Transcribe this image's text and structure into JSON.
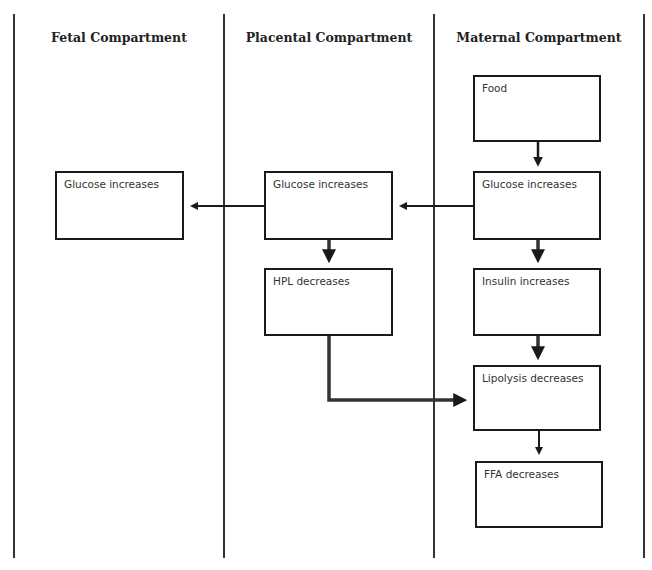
{
  "columns": [
    {
      "title": "Fetal Compartment"
    },
    {
      "title": "Placental Compartment"
    },
    {
      "title": "Maternal Compartment"
    }
  ],
  "boxes": {
    "fetal_glucose": "Glucose increases",
    "placental_glucose": "Glucose increases",
    "hpl": "HPL decreases",
    "food": "Food",
    "maternal_glucose": "Glucose increases",
    "insulin": "Insulin increases",
    "lipolysis": "Lipolysis decreases",
    "ffa": "FFA decreases"
  },
  "edges": [
    {
      "from": "food",
      "to": "maternal_glucose"
    },
    {
      "from": "maternal_glucose",
      "to": "placental_glucose"
    },
    {
      "from": "placental_glucose",
      "to": "fetal_glucose"
    },
    {
      "from": "placental_glucose",
      "to": "hpl"
    },
    {
      "from": "maternal_glucose",
      "to": "insulin"
    },
    {
      "from": "insulin",
      "to": "lipolysis"
    },
    {
      "from": "hpl",
      "to": "lipolysis"
    },
    {
      "from": "lipolysis",
      "to": "ffa"
    }
  ]
}
